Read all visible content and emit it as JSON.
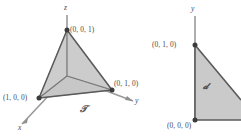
{
  "figure": {
    "background_color": "#ffffff",
    "stroke_color": "#4a4a4a",
    "fill_color": "#cfcfcf",
    "fill_color_light": "#dcdcdc",
    "axis_color": "#9a9a9a"
  },
  "left_diagram": {
    "name": "tetrahedron-diagram",
    "region_label": "𝒯",
    "axes": [
      {
        "name": "z-axis",
        "label": "z"
      },
      {
        "name": "x-axis",
        "label": "x"
      },
      {
        "name": "y-axis",
        "label": "y"
      }
    ],
    "vertices": [
      {
        "name": "vertex-001",
        "label": "(0, 0, 1)"
      },
      {
        "name": "vertex-100",
        "label": "(1, 0, 0)"
      },
      {
        "name": "vertex-010",
        "label": "(0, 1, 0)"
      }
    ]
  },
  "right_diagram": {
    "name": "projection-region-diagram",
    "region_label": "𝒹",
    "axes": [
      {
        "name": "y-axis",
        "label": "y"
      }
    ],
    "vertices": [
      {
        "name": "vertex-010",
        "label": "(0, 1, 0)"
      },
      {
        "name": "vertex-000",
        "label": "(0, 0, 0)"
      }
    ]
  }
}
